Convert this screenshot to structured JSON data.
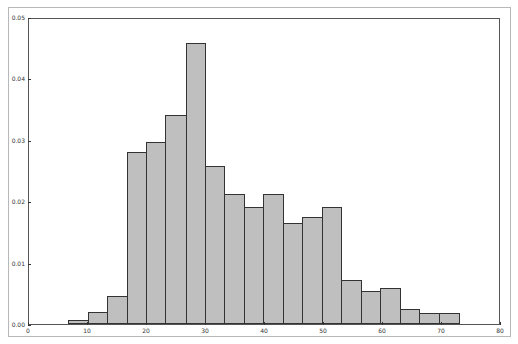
{
  "chart_data": {
    "type": "bar",
    "subtype": "histogram",
    "title": "",
    "xlabel": "",
    "ylabel": "",
    "xlim": [
      0,
      80
    ],
    "ylim": [
      0,
      0.05
    ],
    "grid": false,
    "legend": null,
    "bar_color": "#bfbfbf",
    "edge_color": "#333333",
    "x_ticks": [
      "0",
      "10",
      "20",
      "30",
      "40",
      "50",
      "60",
      "70",
      "80"
    ],
    "y_ticks": [
      "0.00",
      "0.01",
      "0.02",
      "0.03",
      "0.04",
      "0.05"
    ],
    "bin_edges": [
      6.8,
      10.1,
      13.4,
      16.7,
      20.0,
      23.3,
      26.7,
      30.0,
      33.3,
      36.6,
      39.9,
      43.2,
      46.5,
      49.8,
      53.1,
      56.4,
      59.7,
      63.0,
      66.3,
      69.7,
      73.0
    ],
    "values": [
      0.0007,
      0.002,
      0.0046,
      0.028,
      0.0297,
      0.034,
      0.0458,
      0.0257,
      0.0212,
      0.019,
      0.0212,
      0.0165,
      0.0174,
      0.019,
      0.0072,
      0.0053,
      0.0058,
      0.0025,
      0.0018,
      0.0018
    ]
  }
}
